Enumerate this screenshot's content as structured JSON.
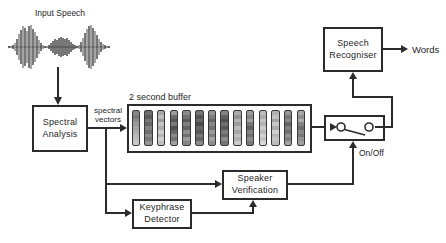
{
  "labels": {
    "input_speech": "Input Speech",
    "spectral_vectors_line1": "spectral",
    "spectral_vectors_line2": "vectors",
    "on_off": "On/Off",
    "words": "Words"
  },
  "boxes": {
    "spectral_analysis": {
      "line1": "Spectral",
      "line2": "Analysis"
    },
    "speech_recogniser": {
      "line1": "Speech",
      "line2": "Recogniser"
    },
    "speaker_verification": {
      "line1": "Speaker",
      "line2": "Verification"
    },
    "keyphrase_detector": {
      "line1": "Keyphrase",
      "line2": "Detector"
    }
  },
  "buffer": {
    "title": "2 second buffer",
    "bars": [
      [
        "#878787",
        "#7a7a7a",
        "#8e8e8e",
        "#999999",
        "#a3a3a3",
        "#adadad",
        "#b6b6b6",
        "#c0c0c0",
        "#c9c9c9"
      ],
      [
        "#6e6e6e",
        "#5c5c5c",
        "#787878",
        "#666666",
        "#828282",
        "#707070",
        "#8c8c8c",
        "#7a7a7a",
        "#969696"
      ],
      [
        "#a8a8a8",
        "#bcbcbc",
        "#9a9a9a",
        "#c4c4c4",
        "#aeaeae",
        "#cccccc",
        "#b4b4b4",
        "#d2d2d2",
        "#c0c0c0"
      ],
      [
        "#9a9a9a",
        "#6a6a6a",
        "#555555",
        "#7a7a7a",
        "#4e4e4e",
        "#686868",
        "#8a8a8a",
        "#747474",
        "#a0a0a0"
      ],
      [
        "#8a8a8a",
        "#707070",
        "#5a5a5a",
        "#808080",
        "#646464",
        "#909090",
        "#6e6e6e",
        "#9a9a9a",
        "#848484"
      ],
      [
        "#767676",
        "#545454",
        "#6a6a6a",
        "#484848",
        "#666666",
        "#585858",
        "#787878",
        "#646464",
        "#8a8a8a"
      ],
      [
        "#949494",
        "#7c7c7c",
        "#666666",
        "#888888",
        "#727272",
        "#9a9a9a",
        "#808080",
        "#a4a4a4",
        "#8e8e8e"
      ],
      [
        "#828282",
        "#606060",
        "#4e4e4e",
        "#6e6e6e",
        "#585858",
        "#7a7a7a",
        "#666666",
        "#8a8a8a",
        "#767676"
      ],
      [
        "#aaaaaa",
        "#949494",
        "#b4b4b4",
        "#9e9e9e",
        "#bcbcbc",
        "#a6a6a6",
        "#c2c2c2",
        "#b0b0b0",
        "#cacaca"
      ],
      [
        "#9c9c9c",
        "#868686",
        "#a4a4a4",
        "#787878",
        "#626262",
        "#828282",
        "#6e6e6e",
        "#8e8e8e",
        "#7a7a7a"
      ],
      [
        "#bcbcbc",
        "#acacac",
        "#c6c6c6",
        "#b2b2b2",
        "#cecece",
        "#bababa",
        "#d4d4d4",
        "#c2c2c2",
        "#dadada"
      ],
      [
        "#b0b0b0",
        "#c0c0c0",
        "#a2a2a2",
        "#c8c8c8",
        "#acacac",
        "#d0d0d0",
        "#b6b6b6",
        "#c4c4c4",
        "#bcbcbc"
      ],
      [
        "#969696",
        "#767676",
        "#8a8a8a",
        "#646464",
        "#828282",
        "#707070",
        "#949494",
        "#7e7e7e",
        "#a0a0a0"
      ],
      [
        "#a6a6a6",
        "#909090",
        "#aeaeae",
        "#848484",
        "#6e6e6e",
        "#888888",
        "#787878",
        "#929292",
        "#9e9e9e"
      ]
    ]
  },
  "waveform": {
    "amplitudes": [
      1,
      1,
      2,
      4,
      8,
      13,
      17,
      21,
      19,
      16,
      21,
      22,
      18,
      15,
      11,
      7,
      4,
      2,
      1,
      1,
      2,
      4,
      6,
      8,
      7,
      9,
      10,
      9,
      8,
      9,
      7,
      5,
      3,
      2,
      1,
      2,
      5,
      9,
      14,
      18,
      21,
      22,
      19,
      16,
      12,
      8,
      5,
      3,
      2,
      1,
      1,
      1
    ],
    "dark_range": [
      20,
      33
    ],
    "stroke_dark": "#2f2f2f",
    "stroke_mid": "#757575",
    "baseline_color": "#606060"
  },
  "colors": {
    "line": "#2b2b2b",
    "text": "#262626",
    "background": "#ffffff",
    "bar_border": "#3a3a3a"
  }
}
